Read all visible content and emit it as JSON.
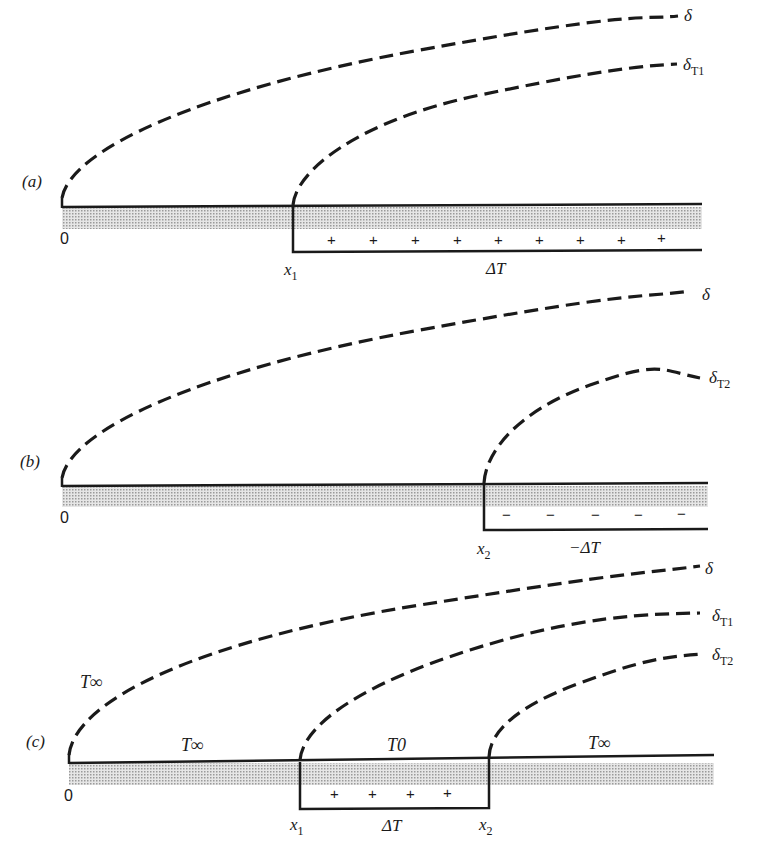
{
  "figure": {
    "panels": [
      {
        "id": "a",
        "label": "(a)",
        "origin_label": "0",
        "curves": [
          {
            "label": "δ",
            "sub": ""
          },
          {
            "label": "δ",
            "sub": "T1"
          }
        ],
        "step_label": "x",
        "step_sub": "1",
        "region_label": "ΔT",
        "signs": [
          "+",
          "+",
          "+",
          "+",
          "+",
          "+",
          "+",
          "+",
          "+"
        ]
      },
      {
        "id": "b",
        "label": "(b)",
        "origin_label": "0",
        "curves": [
          {
            "label": "δ",
            "sub": ""
          },
          {
            "label": "δ",
            "sub": "T2"
          }
        ],
        "step_label": "x",
        "step_sub": "2",
        "region_label": "−ΔT",
        "signs": [
          "−",
          "−",
          "−",
          "−",
          "−"
        ]
      },
      {
        "id": "c",
        "label": "(c)",
        "origin_label": "0",
        "curves": [
          {
            "label": "δ",
            "sub": ""
          },
          {
            "label": "δ",
            "sub": "T1"
          },
          {
            "label": "δ",
            "sub": "T2"
          }
        ],
        "step1_label": "x",
        "step1_sub": "1",
        "step2_label": "x",
        "step2_sub": "2",
        "region_label": "ΔT",
        "signs": [
          "+",
          "+",
          "+",
          "+"
        ],
        "temps": {
          "free_stream": "T∞",
          "wall_left": "T∞",
          "wall_mid": "T0",
          "wall_right": "T∞"
        }
      }
    ],
    "colors": {
      "ink": "#1a1a1a",
      "hatch": "#bdbdbd",
      "background": "#ffffff"
    }
  }
}
